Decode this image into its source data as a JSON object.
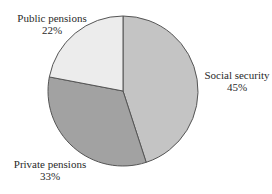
{
  "chart_data": {
    "type": "pie",
    "title": "",
    "categories": [
      "Social security",
      "Private pensions",
      "Public pensions"
    ],
    "values": [
      45,
      33,
      22
    ],
    "unit": "%",
    "start_angle": "top (12 o'clock)",
    "direction": "clockwise",
    "legend": "none (direct labels)",
    "colors": [
      "#c4c4c4",
      "#a2a2a2",
      "#ececec"
    ],
    "labels": [
      {
        "name": "Social security",
        "value": "45%"
      },
      {
        "name": "Private pensions",
        "value": "33%"
      },
      {
        "name": "Public pensions",
        "value": "22%"
      }
    ]
  },
  "style": {
    "outline": "#555555",
    "background": "#ffffff"
  }
}
